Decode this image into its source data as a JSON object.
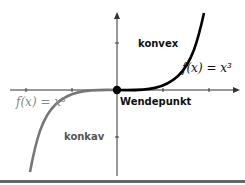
{
  "labels": {
    "convex": "konvex",
    "concave": "konkav",
    "inflection": "Wendepunkt",
    "func_right": "f(x) = x³",
    "func_left": "f(x) = x³"
  },
  "colors": {
    "curve_right": "#000000",
    "curve_left": "#777777",
    "axis": "#333333",
    "point": "#000000",
    "bottom_rule": "#666666"
  }
}
